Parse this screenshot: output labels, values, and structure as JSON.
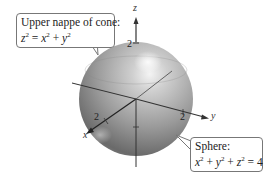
{
  "figure": {
    "type": "3d-surface-illustration",
    "axes": {
      "x": {
        "label": "x",
        "tick": "2"
      },
      "y": {
        "label": "y",
        "tick": "2"
      },
      "z": {
        "label": "z",
        "tick": "2"
      }
    },
    "surfaces": [
      {
        "name": "sphere",
        "equation": "x^2 + y^2 + z^2 = 4",
        "radius": 2
      },
      {
        "name": "upper nappe of cone",
        "equation": "z^2 = x^2 + y^2"
      }
    ],
    "colors": {
      "sphere_light": "#e6e6e6",
      "sphere_mid": "#a8a8a8",
      "sphere_dark": "#5c5c5c",
      "axis": "#333333"
    }
  },
  "callouts": {
    "cone": {
      "title": "Upper nappe of cone:",
      "eq_lhs": "z",
      "eq_rest_a": " = ",
      "eq_x": "x",
      "eq_plus": " + ",
      "eq_y": "y",
      "sup": "2"
    },
    "sphere": {
      "title": "Sphere:",
      "eq_x": "x",
      "eq_y": "y",
      "eq_z": "z",
      "plus": " + ",
      "equals": " = ",
      "rhs": "4",
      "sup": "2"
    }
  }
}
